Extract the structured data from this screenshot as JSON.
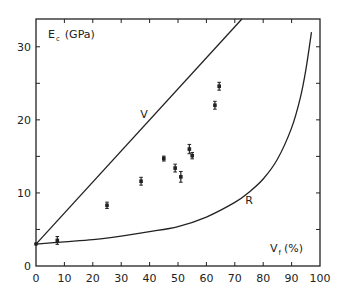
{
  "chart_data": {
    "type": "scatter",
    "title": "",
    "xlabel": "V",
    "xlabel_sub": "f",
    "xlabel_unit": "(%)",
    "ylabel": "E",
    "ylabel_sub": "c",
    "ylabel_unit": "(GPa)",
    "xlim": [
      0,
      100
    ],
    "ylim": [
      0,
      33.8
    ],
    "x_ticks": [
      0,
      10,
      20,
      30,
      40,
      50,
      60,
      70,
      80,
      90,
      100
    ],
    "x_tick_labels": [
      "0",
      "10",
      "20",
      "30",
      "40",
      "50",
      "60",
      "70",
      "80",
      "90",
      "100"
    ],
    "y_ticks": [
      0,
      5,
      10,
      15,
      20,
      25,
      30
    ],
    "y_tick_labels": [
      "0",
      "",
      "10",
      "",
      "20",
      "",
      "30"
    ],
    "grid": false,
    "legend": null,
    "series": [
      {
        "name": "measured",
        "kind": "points_with_error_bars",
        "points": [
          {
            "x": 7.5,
            "y": 3.5,
            "err": 0.4
          },
          {
            "x": 25,
            "y": 8.3,
            "err": 0.3
          },
          {
            "x": 37,
            "y": 11.6,
            "err": 0.4
          },
          {
            "x": 45,
            "y": 14.7,
            "err": 0.2
          },
          {
            "x": 49,
            "y": 13.4,
            "err": 0.4
          },
          {
            "x": 51,
            "y": 12.2,
            "err": 0.6
          },
          {
            "x": 54,
            "y": 16.0,
            "err": 0.5
          },
          {
            "x": 55,
            "y": 15.1,
            "err": 0.3
          },
          {
            "x": 63,
            "y": 22.0,
            "err": 0.4
          },
          {
            "x": 64.5,
            "y": 24.6,
            "err": 0.4
          }
        ]
      },
      {
        "name": "V",
        "kind": "line",
        "description": "Voigt rule of mixtures (linear)",
        "x": [
          0,
          72.5
        ],
        "y": [
          3.0,
          33.8
        ]
      },
      {
        "name": "R",
        "kind": "curve",
        "description": "Reuss (inverse) rule of mixtures",
        "x": [
          0,
          10,
          20,
          30,
          40,
          50,
          60,
          70,
          75,
          80,
          85,
          90,
          93,
          95,
          97
        ],
        "y": [
          3.0,
          3.3,
          3.6,
          4.1,
          4.7,
          5.4,
          6.7,
          8.7,
          10.1,
          11.9,
          14.6,
          18.9,
          22.9,
          26.8,
          32.0
        ]
      }
    ],
    "annotations": [
      {
        "text": "V",
        "x": 38,
        "y": 20.2
      },
      {
        "text": "R",
        "x": 75,
        "y": 8.5
      }
    ]
  }
}
